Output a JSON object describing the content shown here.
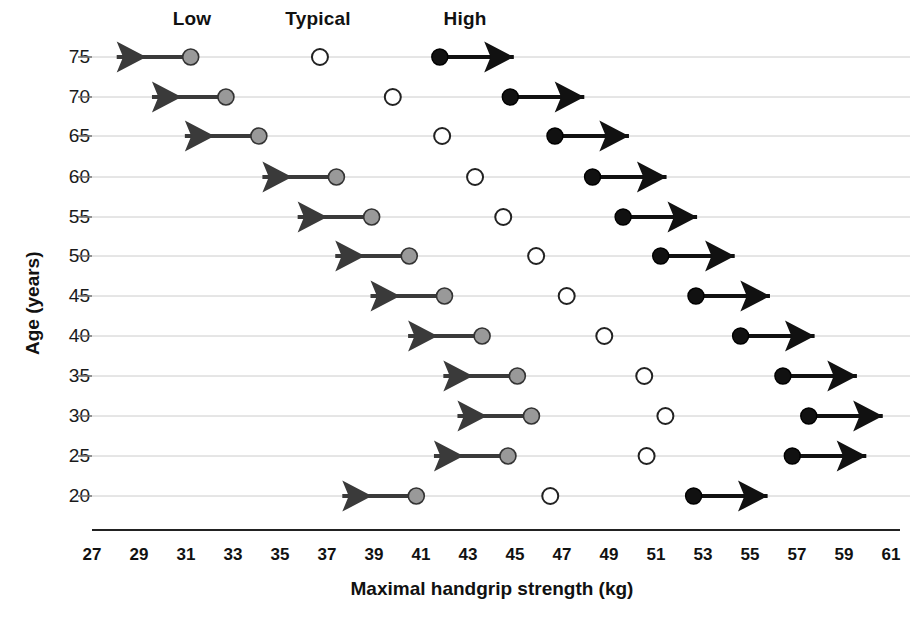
{
  "chart_data": {
    "type": "scatter",
    "title": "",
    "xlabel": "Maximal handgrip strength (kg)",
    "ylabel": "Age (years)",
    "xlim": [
      27,
      61
    ],
    "ylim": [
      17.5,
      77.5
    ],
    "grid": true,
    "legend_position": "top",
    "column_headers": [
      "Low",
      "Typical",
      "High"
    ],
    "xticks": [
      "27",
      "29",
      "31",
      "33",
      "35",
      "37",
      "39",
      "41",
      "43",
      "45",
      "47",
      "49",
      "51",
      "53",
      "55",
      "57",
      "59",
      "61"
    ],
    "xtick_values": [
      27,
      29,
      31,
      33,
      35,
      37,
      39,
      41,
      43,
      45,
      47,
      49,
      51,
      53,
      55,
      57,
      59,
      61
    ],
    "yticks": [
      "75",
      "70",
      "65",
      "60",
      "55",
      "50",
      "45",
      "40",
      "35",
      "30",
      "25",
      "20"
    ],
    "ytick_values": [
      75,
      70,
      65,
      60,
      55,
      50,
      45,
      40,
      35,
      30,
      25,
      20
    ],
    "categories": [
      75,
      70,
      65,
      60,
      55,
      50,
      45,
      40,
      35,
      30,
      25,
      20
    ],
    "series": [
      {
        "name": "Low",
        "marker": "filled-gray-circle",
        "arrow": "left",
        "color": "#999999",
        "edge_color": "#333333",
        "values": [
          31.2,
          32.7,
          34.1,
          37.4,
          38.9,
          40.5,
          42.0,
          43.6,
          45.1,
          45.7,
          44.7,
          40.8
        ]
      },
      {
        "name": "Typical",
        "marker": "open-circle",
        "arrow": "none",
        "color": "#ffffff",
        "edge_color": "#222222",
        "values": [
          36.7,
          39.8,
          41.9,
          43.3,
          44.5,
          45.9,
          47.2,
          48.8,
          50.5,
          51.4,
          50.6,
          46.5
        ]
      },
      {
        "name": "High",
        "marker": "filled-black-circle",
        "arrow": "right",
        "color": "#111111",
        "edge_color": "#000000",
        "values": [
          41.8,
          44.8,
          46.7,
          48.3,
          49.6,
          51.2,
          52.7,
          54.6,
          56.4,
          57.5,
          56.8,
          52.6
        ]
      }
    ]
  },
  "colors": {
    "background": "#ffffff",
    "gridline": "#cccccc",
    "axis": "#222222",
    "low_marker": "#999999",
    "typical_marker": "#ffffff",
    "high_marker": "#111111"
  }
}
